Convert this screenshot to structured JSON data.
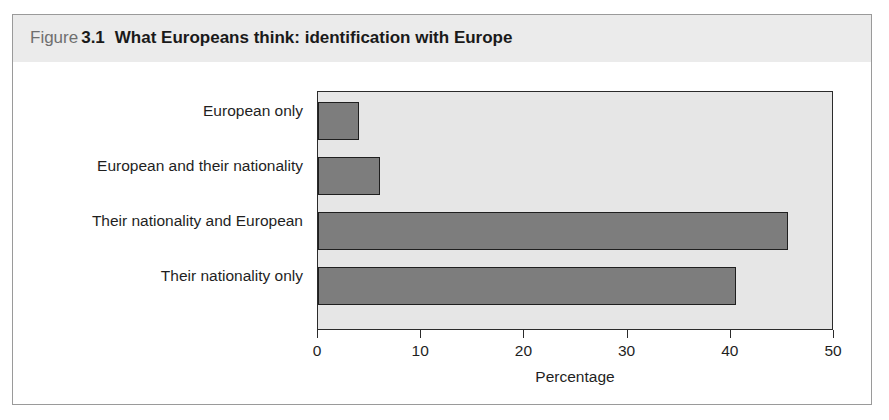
{
  "figure": {
    "label_word": "Figure",
    "number": "3.1",
    "title": "What Europeans think: identification with Europe"
  },
  "colors": {
    "header_band": "#ebebeb",
    "frame_border": "#9a9a9a",
    "plot_background": "#e6e6e6",
    "plot_border": "#2b2b2b",
    "bar_fill": "#7d7d7d",
    "bar_outline": "#1f1f1f",
    "text": "#1f1f1f",
    "caption_muted": "#6f6f6f"
  },
  "chart_data": {
    "type": "bar",
    "orientation": "horizontal",
    "title": "What Europeans think: identification with Europe",
    "categories": [
      "European only",
      "European and their nationality",
      "Their nationality and European",
      "Their nationality only"
    ],
    "values": [
      4,
      6,
      45.5,
      40.5
    ],
    "xlabel": "Percentage",
    "ylabel": "",
    "xlim": [
      0,
      50
    ],
    "xticks": [
      0,
      10,
      20,
      30,
      40,
      50
    ],
    "xtick_labels": [
      "0",
      "10",
      "20",
      "30",
      "40",
      "50"
    ],
    "grid": false,
    "legend": false
  }
}
